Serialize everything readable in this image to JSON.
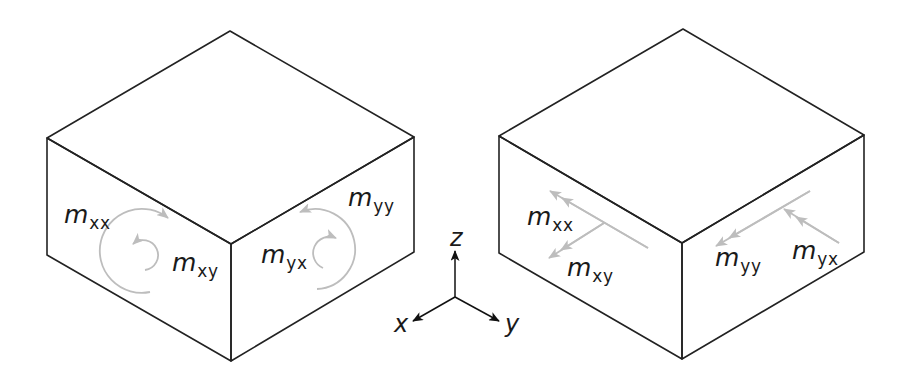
{
  "figure": {
    "left_panel": {
      "title": "",
      "representation": "curved-arrow moment vectors",
      "labels": {
        "mxx": {
          "base": "m",
          "sub": "xx"
        },
        "mxy": {
          "base": "m",
          "sub": "xy"
        },
        "myx": {
          "base": "m",
          "sub": "yx"
        },
        "myy": {
          "base": "m",
          "sub": "yy"
        }
      }
    },
    "right_panel": {
      "title": "",
      "representation": "double-headed arrow moment vectors",
      "labels": {
        "mxx": {
          "base": "m",
          "sub": "xx"
        },
        "mxy": {
          "base": "m",
          "sub": "xy"
        },
        "myy": {
          "base": "m",
          "sub": "yy"
        },
        "myx": {
          "base": "m",
          "sub": "yx"
        }
      }
    },
    "axes": {
      "x": "x",
      "y": "y",
      "z": "z"
    },
    "colors": {
      "edges": "#222222",
      "moment_arrows": "#bdbdbd",
      "axes": "#111111"
    }
  }
}
